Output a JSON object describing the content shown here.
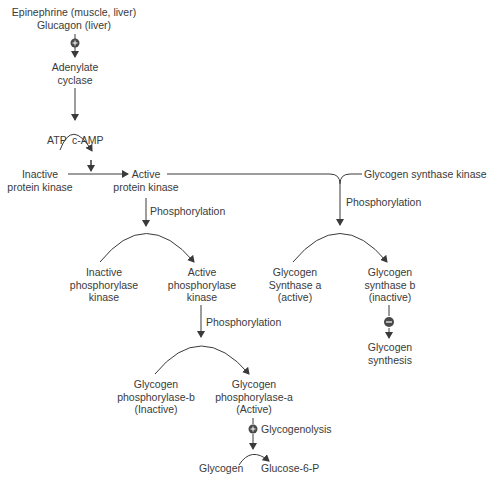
{
  "diagram": {
    "colors": {
      "line": "#3a3a3a",
      "text": "#3a3a3a",
      "background": "#ffffff"
    },
    "nodes": {
      "hormones_line1": "Epinephrine (muscle, liver)",
      "hormones_line2": "Glucagon (liver)",
      "adenylate_line1": "Adenylate",
      "adenylate_line2": "cyclase",
      "atp": "ATP",
      "camp": "c-AMP",
      "inactive_pk_line1": "Inactive",
      "inactive_pk_line2": "protein kinase",
      "active_pk_line1": "Active",
      "active_pk_line2": "protein kinase",
      "gsk": "Glycogen synthase kinase",
      "phos1": "Phosphorylation",
      "phos2": "Phosphorylation",
      "phos3": "Phosphorylation",
      "inactive_phk_line1": "Inactive",
      "inactive_phk_line2": "phosphorylase",
      "inactive_phk_line3": "kinase",
      "active_phk_line1": "Active",
      "active_phk_line2": "phosphorylase",
      "active_phk_line3": "kinase",
      "gsa_line1": "Glycogen",
      "gsa_line2": "Synthase a",
      "gsa_line3": "(active)",
      "gsb_line1": "Glycogen",
      "gsb_line2": "synthase b",
      "gsb_line3": "(inactive)",
      "gsynth_line1": "Glycogen",
      "gsynth_line2": "synthesis",
      "gpb_line1": "Glycogen",
      "gpb_line2": "phosphorylase-b",
      "gpb_line3": "(Inactive)",
      "gpa_line1": "Glycogen",
      "gpa_line2": "phosphorylase-a",
      "gpa_line3": "(Active)",
      "glycogenolysis": "Glycogenolysis",
      "glycogen": "Glycogen",
      "g6p": "Glucose-6-P"
    },
    "symbols": {
      "stimulate": "+",
      "inhibit": "−"
    }
  }
}
